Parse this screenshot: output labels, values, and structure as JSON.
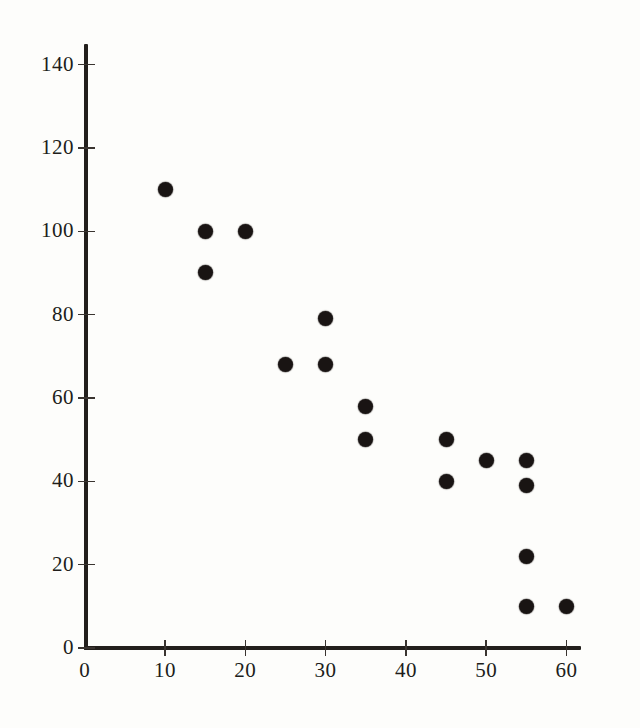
{
  "chart_data": {
    "type": "scatter",
    "title": "",
    "subtitle": "",
    "xlabel": "",
    "ylabel": "",
    "xlim": [
      0,
      62
    ],
    "ylim": [
      0,
      146
    ],
    "x_ticks": [
      0,
      10,
      20,
      30,
      40,
      50,
      60
    ],
    "y_ticks": [
      0,
      20,
      40,
      60,
      80,
      100,
      120,
      140
    ],
    "x_tick_labels": [
      "0",
      "10",
      "20",
      "30",
      "40",
      "50",
      "60"
    ],
    "y_tick_labels": [
      "0",
      "20",
      "40",
      "60",
      "80",
      "100",
      "120",
      "140"
    ],
    "grid": false,
    "legend": null,
    "marker": "filled-circle",
    "marker_color": "#191413",
    "points": [
      {
        "x": 10,
        "y": 110
      },
      {
        "x": 15,
        "y": 100
      },
      {
        "x": 15,
        "y": 90
      },
      {
        "x": 20,
        "y": 100
      },
      {
        "x": 25,
        "y": 68
      },
      {
        "x": 30,
        "y": 79
      },
      {
        "x": 30,
        "y": 68
      },
      {
        "x": 35,
        "y": 58
      },
      {
        "x": 35,
        "y": 50
      },
      {
        "x": 45,
        "y": 50
      },
      {
        "x": 45,
        "y": 40
      },
      {
        "x": 50,
        "y": 45
      },
      {
        "x": 55,
        "y": 45
      },
      {
        "x": 55,
        "y": 39
      },
      {
        "x": 55,
        "y": 22
      },
      {
        "x": 55,
        "y": 10
      },
      {
        "x": 60,
        "y": 10
      }
    ]
  },
  "axes": {
    "origin_px": {
      "x": 84.7,
      "y": 648
    },
    "px_per_x_unit": 8.03,
    "px_per_y_unit": 4.167,
    "axis_color": "#231f1c"
  }
}
